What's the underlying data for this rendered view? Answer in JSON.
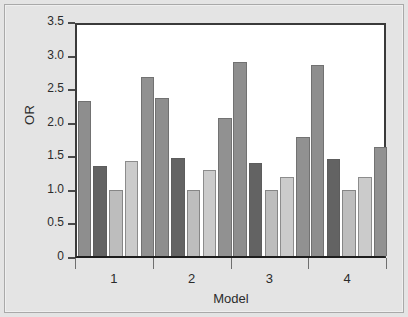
{
  "chart_data": {
    "type": "bar",
    "title": "",
    "subtitle": "",
    "xlabel": "Model",
    "ylabel": "OR",
    "categories": [
      "1",
      "2",
      "3",
      "4"
    ],
    "ylim": [
      0,
      3.5
    ],
    "ytick_labels": [
      "0",
      "0.5",
      "1.0",
      "1.5",
      "2.0",
      "2.5",
      "3.0",
      "3.5"
    ],
    "ytick_values": [
      0,
      0.5,
      1.0,
      1.5,
      2.0,
      2.5,
      3.0,
      3.5
    ],
    "grid": false,
    "legend": "none",
    "series": [
      {
        "name": "Series 1",
        "color": "#8e8e8e",
        "values": [
          2.31,
          2.36,
          2.89,
          2.85
        ]
      },
      {
        "name": "Series 2",
        "color": "#636363",
        "values": [
          1.34,
          1.46,
          1.39,
          1.44
        ]
      },
      {
        "name": "Series 3",
        "color": "#bdbdbd",
        "values": [
          0.99,
          0.98,
          0.98,
          0.98
        ]
      },
      {
        "name": "Series 4",
        "color": "#cbcbcb",
        "values": [
          1.42,
          1.28,
          1.17,
          1.17
        ]
      },
      {
        "name": "Series 5",
        "color": "#919191",
        "values": [
          2.66,
          2.05,
          1.78,
          1.63
        ]
      }
    ]
  },
  "figure": {
    "background_color": "#e4e4e4",
    "plot_background_color": "#ffffff",
    "axis_color": "#2b2b2b"
  }
}
